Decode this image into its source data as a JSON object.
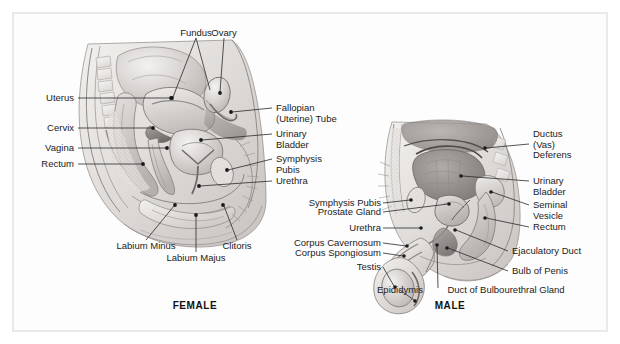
{
  "figure": {
    "title_hidden": "",
    "background_color": "#ffffff",
    "frame_color": "#e9e9e9",
    "leader_color": "#2a2a2a",
    "text_color": "#1b1b1b"
  },
  "panels": [
    {
      "id": "female",
      "caption": "FEMALE",
      "labels": [
        {
          "key": "fundus",
          "text": "Fundus",
          "align": "center"
        },
        {
          "key": "ovary",
          "text": "Ovary",
          "align": "center"
        },
        {
          "key": "uterus",
          "text": "Uterus",
          "align": "right"
        },
        {
          "key": "cervix",
          "text": "Cervix",
          "align": "right"
        },
        {
          "key": "vagina",
          "text": "Vagina",
          "align": "right"
        },
        {
          "key": "rectum",
          "text": "Rectum",
          "align": "right"
        },
        {
          "key": "fallopian",
          "text": "Fallopian\n(Uterine) Tube",
          "align": "left"
        },
        {
          "key": "urinary_bladder",
          "text": "Urinary\nBladder",
          "align": "left"
        },
        {
          "key": "symphysis_pubis",
          "text": "Symphysis\nPubis",
          "align": "left"
        },
        {
          "key": "urethra",
          "text": "Urethra",
          "align": "left"
        },
        {
          "key": "labium_minus",
          "text": "Labium Minus",
          "align": "center"
        },
        {
          "key": "labium_majus",
          "text": "Labium Majus",
          "align": "center"
        },
        {
          "key": "clitoris",
          "text": "Clitoris",
          "align": "center"
        }
      ]
    },
    {
      "id": "male",
      "caption": "MALE",
      "labels": [
        {
          "key": "symphysis_pubis",
          "text": "Symphysis Pubis",
          "align": "right"
        },
        {
          "key": "prostate_gland",
          "text": "Prostate Gland",
          "align": "right"
        },
        {
          "key": "urethra",
          "text": "Urethra",
          "align": "right"
        },
        {
          "key": "corpus_cavernosum",
          "text": "Corpus Cavernosum",
          "align": "right"
        },
        {
          "key": "corpus_spongiosum",
          "text": "Corpus Spongiosum",
          "align": "right"
        },
        {
          "key": "testis",
          "text": "Testis",
          "align": "right"
        },
        {
          "key": "ductus_deferens",
          "text": "Ductus\n(Vas)\nDeferens",
          "align": "left"
        },
        {
          "key": "urinary_bladder",
          "text": "Urinary\nBladder",
          "align": "left"
        },
        {
          "key": "seminal_vesicle",
          "text": "Seminal\nVesicle",
          "align": "left"
        },
        {
          "key": "rectum",
          "text": "Rectum",
          "align": "left"
        },
        {
          "key": "ejaculatory_duct",
          "text": "Ejaculatory Duct",
          "align": "left"
        },
        {
          "key": "bulb_of_penis",
          "text": "Bulb of Penis",
          "align": "left"
        },
        {
          "key": "epididymis",
          "text": "Epididymis",
          "align": "center"
        },
        {
          "key": "duct_bulbourethral",
          "text": "Duct of Bulbourethral Gland",
          "align": "center"
        }
      ]
    }
  ]
}
